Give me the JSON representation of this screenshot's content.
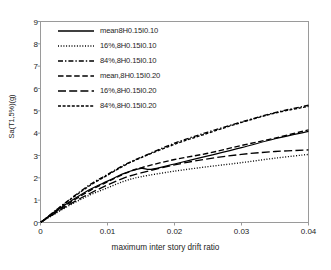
{
  "chart_data": {
    "type": "line",
    "title": "",
    "xlabel": "maximum inter story drift ratio",
    "ylabel": "Sa(T1,5%)(g)",
    "xlim": [
      0,
      0.04
    ],
    "ylim": [
      0,
      9
    ],
    "xticks": [
      "0",
      "0.01",
      "0.02",
      "0.03",
      "0.04"
    ],
    "xtick_values": [
      0,
      0.01,
      0.02,
      0.03,
      0.04
    ],
    "yticks": [
      "0",
      "1",
      "2",
      "3",
      "4",
      "5",
      "6",
      "7",
      "8",
      "9"
    ],
    "ytick_values": [
      0,
      1,
      2,
      3,
      4,
      5,
      6,
      7,
      8,
      9
    ],
    "grid": false,
    "legend_position": "upper-left",
    "series": [
      {
        "name": "mean8H0.15I0.10",
        "style": "solid",
        "x": [
          0,
          0.0025,
          0.005,
          0.0075,
          0.01,
          0.0125,
          0.015,
          0.0165,
          0.02,
          0.025,
          0.03,
          0.035,
          0.04
        ],
        "values": [
          0,
          0.55,
          1.05,
          1.5,
          1.85,
          2.2,
          2.42,
          2.38,
          2.62,
          2.98,
          3.35,
          3.75,
          4.08
        ]
      },
      {
        "name": "16%,8H0.15I0.10",
        "style": "dotted",
        "x": [
          0,
          0.0025,
          0.005,
          0.0075,
          0.01,
          0.0125,
          0.015,
          0.02,
          0.025,
          0.03,
          0.035,
          0.04
        ],
        "values": [
          0,
          0.45,
          0.88,
          1.25,
          1.55,
          1.85,
          2.05,
          2.3,
          2.5,
          2.68,
          2.88,
          3.05
        ]
      },
      {
        "name": "84%,8H0.15I0.10",
        "style": "dashdot",
        "x": [
          0,
          0.0025,
          0.005,
          0.0075,
          0.01,
          0.0125,
          0.015,
          0.02,
          0.025,
          0.03,
          0.035,
          0.04
        ],
        "values": [
          0,
          0.6,
          1.18,
          1.72,
          2.15,
          2.58,
          2.92,
          3.55,
          4.05,
          4.5,
          4.92,
          5.25
        ]
      },
      {
        "name": "mean,8H0.15I0.20",
        "style": "dashed",
        "x": [
          0,
          0.0025,
          0.005,
          0.0075,
          0.01,
          0.0125,
          0.015,
          0.02,
          0.025,
          0.03,
          0.035,
          0.04
        ],
        "values": [
          0,
          0.52,
          1.0,
          1.45,
          1.82,
          2.18,
          2.45,
          2.82,
          3.1,
          3.45,
          3.78,
          4.15
        ]
      },
      {
        "name": "16%,8H0.15I0.20",
        "style": "longdash",
        "x": [
          0,
          0.0025,
          0.005,
          0.0075,
          0.01,
          0.0125,
          0.015,
          0.02,
          0.025,
          0.03,
          0.035,
          0.04
        ],
        "values": [
          0,
          0.48,
          0.92,
          1.32,
          1.68,
          2.0,
          2.22,
          2.58,
          2.85,
          3.05,
          3.18,
          3.25
        ]
      },
      {
        "name": "84%,8H0.15I0.20",
        "style": "finedash",
        "x": [
          0,
          0.0025,
          0.005,
          0.0075,
          0.01,
          0.0125,
          0.015,
          0.02,
          0.025,
          0.03,
          0.035,
          0.04
        ],
        "values": [
          0,
          0.58,
          1.15,
          1.68,
          2.12,
          2.55,
          2.9,
          3.5,
          4.0,
          4.48,
          4.9,
          5.2
        ]
      }
    ]
  },
  "legend": {
    "items": [
      {
        "label": "mean8H0.15I0.10"
      },
      {
        "label": "16%,8H0.15I0.10"
      },
      {
        "label": "84%,8H0.15I0.10"
      },
      {
        "label": "mean,8H0.15I0.20"
      },
      {
        "label": "16%,8H0.15I0.20"
      },
      {
        "label": "84%,8H0.15I0.20"
      }
    ]
  },
  "colors": {
    "line": "#000000",
    "axis": "#8c8c8c",
    "text": "#1d1d1d",
    "background": "#ffffff"
  }
}
